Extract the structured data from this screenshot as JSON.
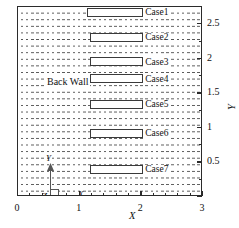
{
  "chart_data": {
    "type": "diagram",
    "title": "",
    "xlabel": "X",
    "ylabel": "Y",
    "xlim": [
      0,
      3
    ],
    "ylim": [
      0,
      2.75
    ],
    "grid": "horizontal-dashed-hatch",
    "xticks": [
      "0",
      "1",
      "2",
      "3"
    ],
    "xtick_values": [
      0,
      1,
      2,
      3
    ],
    "yticks": [
      "0.5",
      "1",
      "1.5",
      "2",
      "2.5"
    ],
    "ytick_values": [
      0.5,
      1,
      1.5,
      2,
      2.5
    ],
    "annotations": [
      {
        "label": "Back Wall",
        "x": 0.2,
        "y": 1.52
      }
    ],
    "blocks": [
      {
        "label": "Case1",
        "x_start": 1.12,
        "x_end": 2.03,
        "y": 2.69,
        "width": 0.91
      },
      {
        "label": "Case2",
        "x_start": 1.16,
        "x_end": 2.03,
        "y": 2.31,
        "width": 0.87
      },
      {
        "label": "Case3",
        "x_start": 1.16,
        "x_end": 2.03,
        "y": 1.96,
        "width": 0.87
      },
      {
        "label": "Case4",
        "x_start": 1.16,
        "x_end": 2.03,
        "y": 1.71,
        "width": 0.87
      },
      {
        "label": "Case5",
        "x_start": 1.16,
        "x_end": 2.03,
        "y": 1.34,
        "width": 0.87
      },
      {
        "label": "Case6",
        "x_start": 1.16,
        "x_end": 2.03,
        "y": 0.92,
        "width": 0.87
      },
      {
        "label": "Case7",
        "x_start": 1.16,
        "x_end": 2.03,
        "y": 0.4,
        "width": 0.87
      }
    ],
    "coordinate_triad": {
      "x_axis_label": "X",
      "y_axis_label": "Y",
      "z_axis_label": "Z"
    }
  },
  "axis": {
    "x_label": "X",
    "y_label": "Y"
  }
}
